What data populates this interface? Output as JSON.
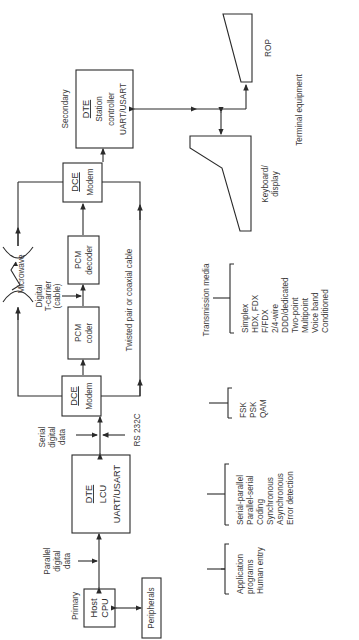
{
  "primary": {
    "label": "Primary",
    "host_cpu": [
      "Host",
      "CPU"
    ],
    "peripherals": "Peripherals",
    "parallel_data": [
      "Parallel",
      "digital",
      "data"
    ],
    "dte_box": {
      "title": "DTE",
      "line1": "LCU",
      "line2": "UART/USART"
    }
  },
  "interface": {
    "serial_data": [
      "Serial",
      "digital",
      "data"
    ],
    "rs232": "RS 232C"
  },
  "dce_bottom": {
    "title": "DCE",
    "line1": "Modem"
  },
  "dce_top": {
    "title": "DCE",
    "line1": "Modem"
  },
  "pcm_coder": [
    "PCM",
    "coder"
  ],
  "pcm_decoder": [
    "PCM",
    "decoder"
  ],
  "links": {
    "microwave": "Microwave",
    "t_carrier": [
      "Digital",
      "T-carrier",
      "(cable)"
    ],
    "twisted_pair": "Twisted pair or coaxial cable"
  },
  "secondary": {
    "label": "Secondary",
    "dte_box": {
      "title": "DTE",
      "line1": "Station",
      "line2": "controller",
      "line3": "UART/USART"
    }
  },
  "terminals": {
    "rop": "ROP",
    "keyboard": [
      "Keyboard/",
      "display"
    ],
    "caption": "Terminal equipment"
  },
  "brackets": {
    "host": [
      "Application",
      "programs",
      "Human entry"
    ],
    "dte": [
      "Serial-parallel",
      "Parallel-serial",
      "Coding",
      "Synchronous",
      "Asynchronous",
      "Error detection"
    ],
    "modem": [
      "FSK",
      "PSK",
      "QAM"
    ],
    "media_title": "Transmission media",
    "media": [
      "Simplex",
      "HDX, FDX",
      "F/FDX",
      "2/4-wire",
      "DDD/dedicated",
      "Two-point",
      "Multipoint",
      "Voice band",
      "Conditioned"
    ]
  }
}
